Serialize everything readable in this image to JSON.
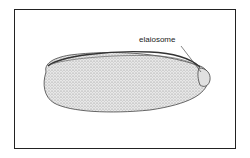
{
  "figure": {
    "labels": {
      "elaiosome": "elaiosome"
    },
    "colors": {
      "frame": "#222222",
      "seed_fill": "#d9d9d9",
      "ink": "#333333"
    }
  }
}
